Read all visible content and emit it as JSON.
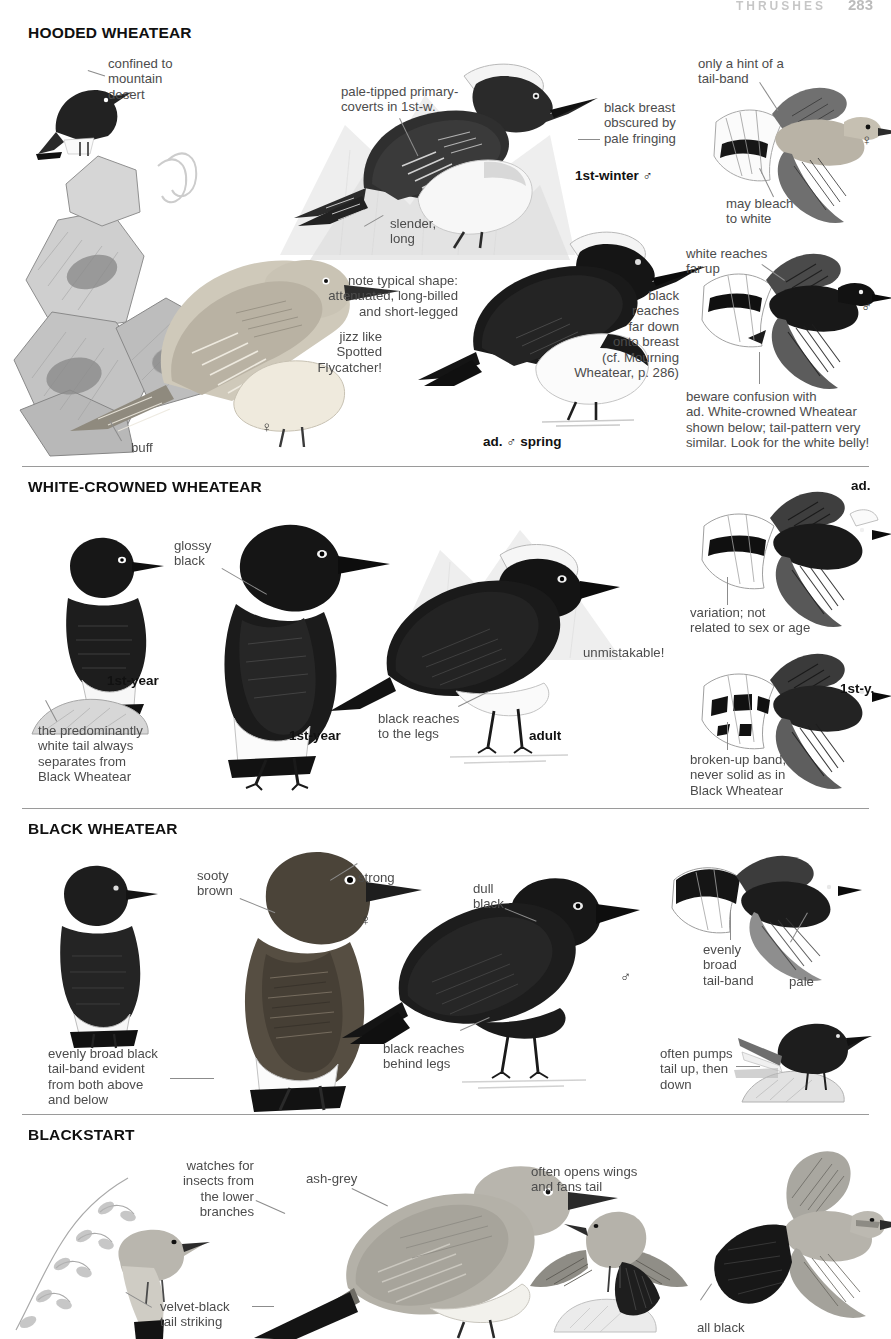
{
  "page": {
    "running_head": "THRUSHES",
    "page_number": "283",
    "width": 891,
    "height": 1339
  },
  "palette": {
    "ink": "#1a1a1a",
    "note_grey": "#4c4c4c",
    "leader_grey": "#8c8c8c",
    "rule_grey": "#9a9a9a",
    "plumage_black": "#1c1c1c",
    "plumage_dark": "#3a3a3a",
    "plumage_mid": "#7d7d7d",
    "plumage_pale": "#c8c6c0",
    "plumage_buff": "#ded7c7",
    "white": "#ffffff"
  },
  "sections": [
    {
      "id": "hooded-wheatear",
      "title": "HOODED WHEATEAR",
      "notes": [
        {
          "id": "confined",
          "text": "confined to\nmountain\ndesert",
          "x": 108,
          "y": 56,
          "align": "left"
        },
        {
          "id": "pale-tipped",
          "text": "pale-tipped primary-\ncoverts in 1st-w.",
          "x": 341,
          "y": 84,
          "align": "left"
        },
        {
          "id": "black-breast",
          "text": "black breast\nobscured by\npale fringing",
          "x": 604,
          "y": 100,
          "align": "left"
        },
        {
          "id": "only-hint",
          "text": "only a hint of a\ntail-band",
          "x": 698,
          "y": 56,
          "align": "left"
        },
        {
          "id": "may-bleach",
          "text": "may bleach\nto white",
          "x": 726,
          "y": 196,
          "align": "left"
        },
        {
          "id": "slender-long",
          "text": "slender,\nlong",
          "x": 390,
          "y": 216,
          "align": "left"
        },
        {
          "id": "note-typical",
          "text": "note typical shape:\nattenuated, long-billed\nand short-legged",
          "x": 458,
          "y": 273,
          "align": "right"
        },
        {
          "id": "jizz",
          "text": "jizz like\nSpotted\nFlycatcher!",
          "x": 382,
          "y": 329,
          "align": "right"
        },
        {
          "id": "black-reaches",
          "text": "black\nreaches\nfar down\nonto breast\n(cf. Mourning\nWheatear, p. 286)",
          "x": 679,
          "y": 288,
          "align": "right"
        },
        {
          "id": "white-reaches",
          "text": "white reaches\nfar up",
          "x": 686,
          "y": 246,
          "align": "left"
        },
        {
          "id": "beware",
          "text": "beware confusion with\nad. White-crowned Wheatear\nshown below; tail-pattern very\nsimilar. Look for the white belly!",
          "x": 686,
          "y": 389,
          "align": "left"
        },
        {
          "id": "buff",
          "text": "buff",
          "x": 131,
          "y": 440,
          "align": "left"
        }
      ],
      "labels": [
        {
          "id": "first-winter-male",
          "text": "1st-winter ♂",
          "x": 575,
          "y": 168
        },
        {
          "id": "ad-male-spring",
          "text": "ad. ♂ spring",
          "x": 483,
          "y": 434
        }
      ],
      "sex_marks": [
        {
          "id": "female-perched",
          "text": "♀",
          "x": 261,
          "y": 418
        },
        {
          "id": "female-flight",
          "text": "♀",
          "x": 861,
          "y": 139
        },
        {
          "id": "male-flight",
          "text": "♂",
          "x": 861,
          "y": 306
        }
      ]
    },
    {
      "id": "white-crowned-wheatear",
      "title": "WHITE-CROWNED WHEATEAR",
      "notes": [
        {
          "id": "glossy-black",
          "text": "glossy\nblack",
          "x": 174,
          "y": 538,
          "align": "left"
        },
        {
          "id": "unmistakable",
          "text": "unmistakable!",
          "x": 583,
          "y": 645,
          "align": "left"
        },
        {
          "id": "predominantly-white",
          "text": "the predominantly\nwhite tail always\nseparates from\nBlack Wheatear",
          "x": 38,
          "y": 723,
          "align": "left"
        },
        {
          "id": "black-reaches-legs",
          "text": "black reaches\nto the legs",
          "x": 378,
          "y": 711,
          "align": "left"
        },
        {
          "id": "variation",
          "text": "variation; not\nrelated to sex or age",
          "x": 690,
          "y": 605,
          "align": "left"
        },
        {
          "id": "broken-up-band",
          "text": "broken-up band,\nnever solid as in\nBlack Wheatear",
          "x": 690,
          "y": 752,
          "align": "left"
        }
      ],
      "labels": [
        {
          "id": "first-year-left",
          "text": "1st-year",
          "x": 107,
          "y": 673
        },
        {
          "id": "first-year-mid",
          "text": "1st-year",
          "x": 289,
          "y": 728
        },
        {
          "id": "adult",
          "text": "adult",
          "x": 529,
          "y": 728
        },
        {
          "id": "ad-flight",
          "text": "ad.",
          "x": 851,
          "y": 478
        },
        {
          "id": "first-y-flight",
          "text": "1st-y.",
          "x": 840,
          "y": 681
        }
      ],
      "sex_marks": []
    },
    {
      "id": "black-wheatear",
      "title": "BLACK WHEATEAR",
      "notes": [
        {
          "id": "sooty-brown",
          "text": "sooty\nbrown",
          "x": 197,
          "y": 868,
          "align": "left"
        },
        {
          "id": "strong",
          "text": "strong",
          "x": 358,
          "y": 870,
          "align": "left"
        },
        {
          "id": "dull-black",
          "text": "dull\nblack",
          "x": 473,
          "y": 881,
          "align": "left"
        },
        {
          "id": "evenly-broad-tailband",
          "text": "evenly\nbroad\ntail-band",
          "x": 703,
          "y": 942,
          "align": "left"
        },
        {
          "id": "pale",
          "text": "pale",
          "x": 789,
          "y": 974,
          "align": "left"
        },
        {
          "id": "evenly-broad-black",
          "text": "evenly broad black\ntail-band evident\nfrom both above\nand below",
          "x": 48,
          "y": 1046,
          "align": "left"
        },
        {
          "id": "black-reaches-behind",
          "text": "black reaches\nbehind legs",
          "x": 383,
          "y": 1041,
          "align": "left"
        },
        {
          "id": "often-pumps",
          "text": "often pumps\ntail up, then\ndown",
          "x": 660,
          "y": 1046,
          "align": "left"
        }
      ],
      "labels": [],
      "sex_marks": [
        {
          "id": "female-black-wheatear",
          "text": "♀",
          "x": 360,
          "y": 919
        },
        {
          "id": "male-black-wheatear",
          "text": "♂",
          "x": 620,
          "y": 976
        }
      ]
    },
    {
      "id": "blackstart",
      "title": "BLACKSTART",
      "notes": [
        {
          "id": "watches-for-insects",
          "text": "watches for\ninsects from\nthe lower\nbranches",
          "x": 254,
          "y": 1158,
          "align": "right"
        },
        {
          "id": "ash-grey",
          "text": "ash-grey",
          "x": 306,
          "y": 1171,
          "align": "left"
        },
        {
          "id": "velvet-black",
          "text": "velvet-black\ntail striking",
          "x": 160,
          "y": 1299,
          "align": "left"
        },
        {
          "id": "often-opens-wings",
          "text": "often opens wings\nand fans tail",
          "x": 531,
          "y": 1164,
          "align": "left"
        },
        {
          "id": "all-black",
          "text": "all black",
          "x": 697,
          "y": 1320,
          "align": "left"
        }
      ],
      "labels": [],
      "sex_marks": []
    }
  ],
  "icons": {
    "perched_bird": "perched-bird-icon",
    "flying_bird": "flying-bird-icon",
    "rock": "rock-icon",
    "branch": "branch-icon",
    "male_symbol": "male-symbol-icon",
    "female_symbol": "female-symbol-icon"
  }
}
